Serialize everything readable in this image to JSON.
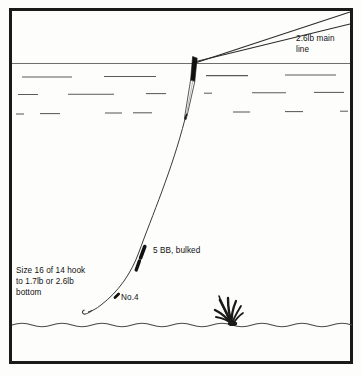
{
  "diagram": {
    "type": "fishing-rig-cross-section",
    "colors": {
      "border": "#1a1a1a",
      "background": "#fdfdfb",
      "line": "#2b2b2b",
      "water_texture": "#555555",
      "shot": "#111111",
      "weed": "#1a1a1a",
      "text": "#111111"
    },
    "labels": {
      "main_line": "2.6lb main\nline",
      "shot_group": "5 BB, bulked",
      "dropper_shot": "No.4",
      "hook_and_bottom": "Size 16 of 14 hook\nto 1.7lb or 2.6lb\nbottom"
    },
    "components": {
      "main_line_breaking_strain": "2.6lb",
      "bulk_shot": "5 BB",
      "dropper_shot": "No.4",
      "hook_sizes": "16 or 14",
      "hooklength_options": "1.7lb or 2.6lb"
    },
    "scene": {
      "water_surface_label": "water surface",
      "riverbed_label": "riverbed",
      "weed_label": "weed tuft",
      "float_label": "float"
    }
  }
}
